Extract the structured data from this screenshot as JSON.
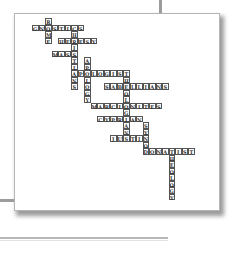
{
  "puzzle": {
    "type": "crossword",
    "cell_size": 6.5,
    "words": [
      {
        "word": "ROME",
        "dir": "down",
        "col": 2,
        "row": 0
      },
      {
        "word": "GNOSTICS",
        "dir": "across",
        "col": 0,
        "row": 1
      },
      {
        "word": "CHRISTIANS",
        "dir": "down",
        "col": 6,
        "row": 1
      },
      {
        "word": "HERESY",
        "dir": "across",
        "col": 4,
        "row": 3
      },
      {
        "word": "MASS",
        "dir": "across",
        "col": 3,
        "row": 5
      },
      {
        "word": "APOLOGY",
        "dir": "down",
        "col": 8,
        "row": 6
      },
      {
        "word": "APOLOGIST",
        "dir": "across",
        "col": 6,
        "row": 8
      },
      {
        "word": "THEOLOGIAN",
        "dir": "down",
        "col": 14,
        "row": 8
      },
      {
        "word": "SABELLIANS",
        "dir": "across",
        "col": 11,
        "row": 10
      },
      {
        "word": "MARCIONITES",
        "dir": "across",
        "col": 9,
        "row": 13
      },
      {
        "word": "CYPRIAN",
        "dir": "across",
        "col": 10,
        "row": 15
      },
      {
        "word": "SYNOD",
        "dir": "down",
        "col": 17,
        "row": 16
      },
      {
        "word": "JUSTIN",
        "dir": "across",
        "col": 12,
        "row": 18
      },
      {
        "word": "DONATIST",
        "dir": "across",
        "col": 17,
        "row": 20
      },
      {
        "word": "THEOLOGY",
        "dir": "down",
        "col": 21,
        "row": 20
      }
    ]
  }
}
